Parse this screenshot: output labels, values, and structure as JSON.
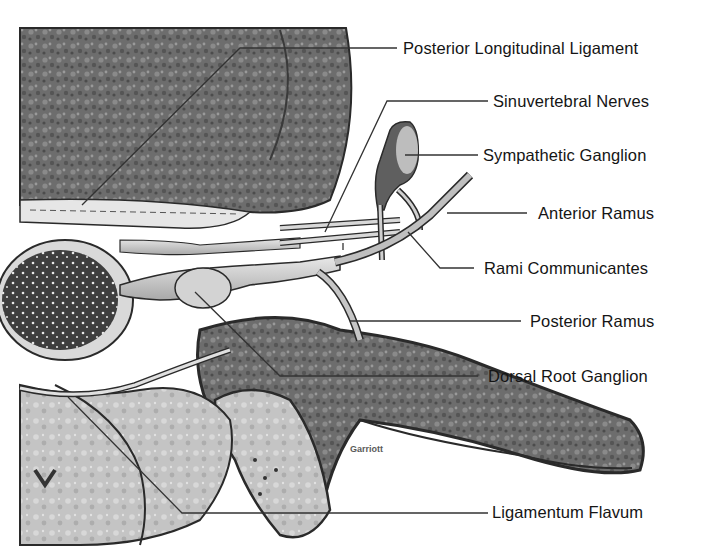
{
  "diagram": {
    "labels": [
      {
        "id": "posterior-longitudinal-ligament",
        "text": "Posterior Longitudinal Ligament"
      },
      {
        "id": "sinuvertebral-nerves",
        "text": "Sinuvertebral Nerves"
      },
      {
        "id": "sympathetic-ganglion",
        "text": "Sympathetic Ganglion"
      },
      {
        "id": "anterior-ramus",
        "text": "Anterior Ramus"
      },
      {
        "id": "rami-communicantes",
        "text": "Rami Communicantes"
      },
      {
        "id": "posterior-ramus",
        "text": "Posterior Ramus"
      },
      {
        "id": "dorsal-root-ganglion",
        "text": "Dorsal Root Ganglion"
      },
      {
        "id": "ligamentum-flavum",
        "text": "Ligamentum Flavum"
      }
    ],
    "credit": "Garriott",
    "colors": {
      "background": "#ffffff",
      "bone_dark": "#5e5e5e",
      "bone_light": "#c9c9c9",
      "nerve": "#d8d8d8",
      "outline": "#2a2a2a",
      "text": "#151515"
    }
  }
}
